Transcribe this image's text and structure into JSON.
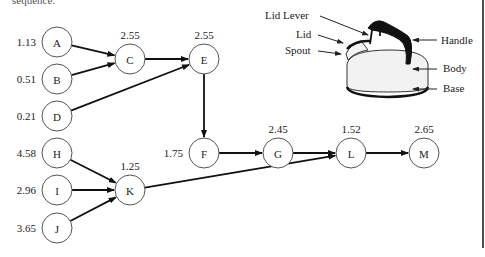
{
  "caption_fragment": "sequence.",
  "network": {
    "nodes": [
      {
        "id": "A",
        "x": 57,
        "y": 42,
        "duration": "1.13",
        "dur_pos": "left"
      },
      {
        "id": "B",
        "x": 57,
        "y": 79,
        "duration": "0.51",
        "dur_pos": "left"
      },
      {
        "id": "D",
        "x": 57,
        "y": 116,
        "duration": "0.21",
        "dur_pos": "left"
      },
      {
        "id": "C",
        "x": 130,
        "y": 59,
        "duration": "2.55",
        "dur_pos": "top"
      },
      {
        "id": "E",
        "x": 204,
        "y": 59,
        "duration": "2.55",
        "dur_pos": "top"
      },
      {
        "id": "F",
        "x": 204,
        "y": 153,
        "duration": "1.75",
        "dur_pos": "left"
      },
      {
        "id": "G",
        "x": 278,
        "y": 153,
        "duration": "2.45",
        "dur_pos": "top"
      },
      {
        "id": "L",
        "x": 351,
        "y": 153,
        "duration": "1.52",
        "dur_pos": "top"
      },
      {
        "id": "M",
        "x": 424,
        "y": 153,
        "duration": "2.65",
        "dur_pos": "top"
      },
      {
        "id": "H",
        "x": 57,
        "y": 153,
        "duration": "4.58",
        "dur_pos": "left"
      },
      {
        "id": "I",
        "x": 57,
        "y": 190,
        "duration": "2.96",
        "dur_pos": "left"
      },
      {
        "id": "J",
        "x": 57,
        "y": 228,
        "duration": "3.65",
        "dur_pos": "left"
      },
      {
        "id": "K",
        "x": 130,
        "y": 190,
        "duration": "1.25",
        "dur_pos": "top"
      }
    ],
    "edges": [
      [
        "A",
        "C"
      ],
      [
        "B",
        "C"
      ],
      [
        "C",
        "E"
      ],
      [
        "D",
        "E"
      ],
      [
        "E",
        "F"
      ],
      [
        "F",
        "G"
      ],
      [
        "G",
        "L"
      ],
      [
        "L",
        "M"
      ],
      [
        "H",
        "K"
      ],
      [
        "I",
        "K"
      ],
      [
        "J",
        "K"
      ],
      [
        "K",
        "L"
      ]
    ]
  },
  "kettle": {
    "labels": {
      "lid_lever": "Lid Lever",
      "lid": "Lid",
      "spout": "Spout",
      "handle": "Handle",
      "body": "Body",
      "base": "Base"
    }
  }
}
